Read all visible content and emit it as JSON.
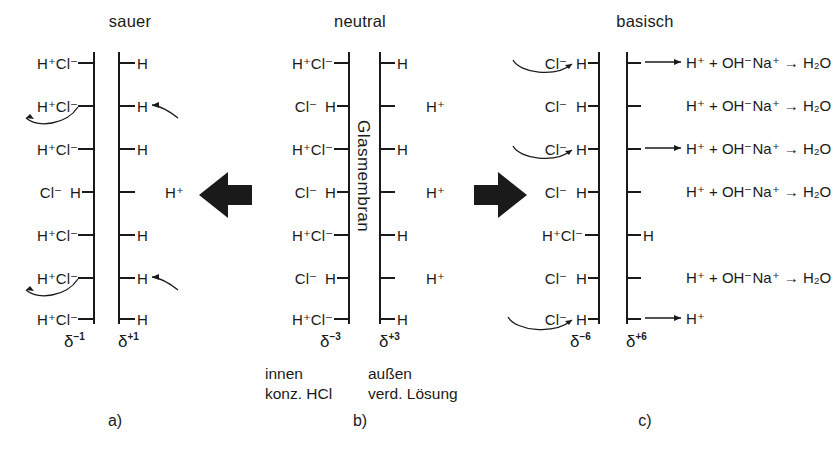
{
  "figure": {
    "panels": [
      {
        "id": "a",
        "title": "sauer",
        "caption": "a)",
        "delta_inner": "δ",
        "delta_inner_sup": "−1",
        "delta_outer": "δ",
        "delta_outer_sup": "+1",
        "rows": [
          {
            "left": "H⁺Cl⁻",
            "inner": "",
            "outer": "H",
            "right": "",
            "curve": false
          },
          {
            "left": "H⁺Cl⁻",
            "inner": "",
            "outer": "H",
            "right": "",
            "curve": true
          },
          {
            "left": "H⁺Cl⁻",
            "inner": "",
            "outer": "H",
            "right": "",
            "curve": false
          },
          {
            "left": "Cl⁻",
            "inner": "H",
            "outer": "",
            "right": "H⁺",
            "curve": false
          },
          {
            "left": "H⁺Cl⁻",
            "inner": "",
            "outer": "H",
            "right": "",
            "curve": false
          },
          {
            "left": "H⁺Cl⁻",
            "inner": "",
            "outer": "H",
            "right": "",
            "curve": true
          },
          {
            "left": "H⁺Cl⁻",
            "inner": "",
            "outer": "H",
            "right": "",
            "curve": false
          }
        ]
      },
      {
        "id": "b",
        "title": "neutral",
        "caption": "b)",
        "membrane_label": "Glasmembran",
        "delta_inner": "δ",
        "delta_inner_sup": "−3",
        "delta_outer": "δ",
        "delta_outer_sup": "+3",
        "note_inner_line1": "innen",
        "note_inner_line2": "konz. HCl",
        "note_outer_line1": "außen",
        "note_outer_line2": "verd. Lösung",
        "rows": [
          {
            "left": "H⁺Cl⁻",
            "inner": "",
            "outer": "H",
            "right": ""
          },
          {
            "left": "Cl⁻",
            "inner": "H",
            "outer": "",
            "right": "H⁺"
          },
          {
            "left": "H⁺Cl⁻",
            "inner": "",
            "outer": "H",
            "right": ""
          },
          {
            "left": "Cl⁻",
            "inner": "H",
            "outer": "",
            "right": "H⁺"
          },
          {
            "left": "H⁺Cl⁻",
            "inner": "",
            "outer": "H",
            "right": ""
          },
          {
            "left": "Cl⁻",
            "inner": "H",
            "outer": "",
            "right": "H⁺"
          },
          {
            "left": "H⁺Cl⁻",
            "inner": "",
            "outer": "H",
            "right": ""
          }
        ]
      },
      {
        "id": "c",
        "title": "basisch",
        "caption": "c)",
        "delta_inner": "δ",
        "delta_inner_sup": "−6",
        "delta_outer": "δ",
        "delta_outer_sup": "+6",
        "rows": [
          {
            "left": "Cl⁻",
            "inner": "H",
            "outer": "",
            "reaction": "H⁺ + OH⁻Na⁺ → H₂O",
            "straight_arrow": true,
            "curve": true
          },
          {
            "left": "Cl⁻",
            "inner": "H",
            "outer": "",
            "reaction": "H⁺ + OH⁻Na⁺ → H₂O",
            "straight_arrow": false,
            "curve": false
          },
          {
            "left": "Cl⁻",
            "inner": "H",
            "outer": "",
            "reaction": "H⁺ + OH⁻Na⁺ → H₂O",
            "straight_arrow": true,
            "curve": true
          },
          {
            "left": "Cl⁻",
            "inner": "H",
            "outer": "",
            "reaction": "H⁺ + OH⁻Na⁺ → H₂O",
            "straight_arrow": false,
            "curve": false
          },
          {
            "left": "H⁺Cl⁻",
            "inner": "",
            "outer": "H",
            "reaction": "",
            "straight_arrow": false,
            "curve": false
          },
          {
            "left": "Cl⁻",
            "inner": "H",
            "outer": "",
            "reaction": "H⁺ + OH⁻Na⁺ → H₂O",
            "straight_arrow": false,
            "curve": false
          },
          {
            "left": "Cl⁻",
            "inner": "H",
            "outer": "",
            "reaction": "H⁺",
            "straight_arrow": true,
            "curve": true
          }
        ]
      }
    ],
    "transport_arrow_left": "arrow-left",
    "transport_arrow_right": "arrow-right",
    "colors": {
      "ink": "#1a1a1a",
      "background": "#ffffff"
    }
  }
}
